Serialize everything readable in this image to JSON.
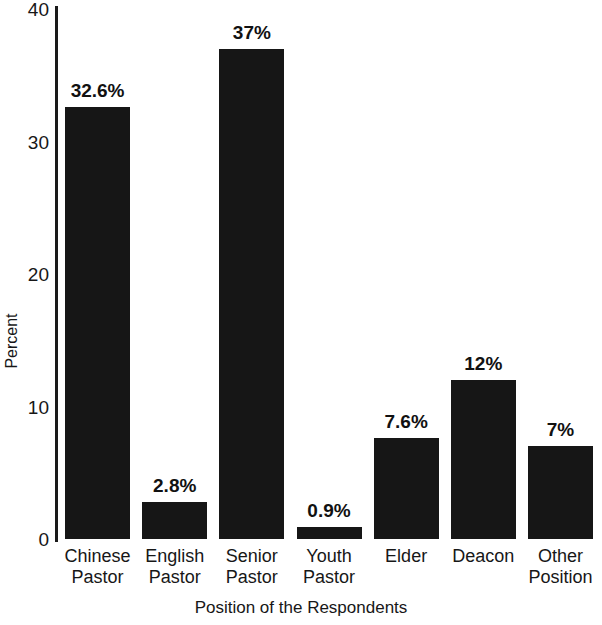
{
  "chart_data": {
    "type": "bar",
    "title": "",
    "xlabel": "Position of the Respondents",
    "ylabel": "Percent",
    "categories": [
      "Chinese Pastor",
      "English Pastor",
      "Senior Pastor",
      "Youth Pastor",
      "Elder",
      "Deacon",
      "Other Position"
    ],
    "category_lines": [
      [
        "Chinese",
        "Pastor"
      ],
      [
        "English",
        "Pastor"
      ],
      [
        "Senior",
        "Pastor"
      ],
      [
        "Youth",
        "Pastor"
      ],
      [
        "Elder",
        ""
      ],
      [
        "Deacon",
        ""
      ],
      [
        "Other",
        "Position"
      ]
    ],
    "values": [
      32.6,
      2.8,
      37,
      0.9,
      7.6,
      12,
      7
    ],
    "data_labels": [
      "32.6%",
      "2.8%",
      "37%",
      "0.9%",
      "7.6%",
      "12%",
      "7%"
    ],
    "ylim": [
      0,
      40
    ],
    "yticks": [
      0,
      10,
      20,
      30,
      40
    ],
    "ytick_labels": [
      "0",
      "10",
      "20",
      "30",
      "40"
    ],
    "grid": false,
    "legend": null,
    "bar_color": "#161616"
  }
}
